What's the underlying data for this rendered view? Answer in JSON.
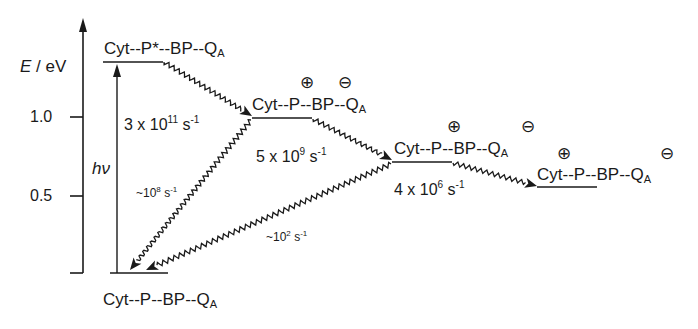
{
  "diagram": {
    "type": "energy-level-diagram",
    "axis": {
      "label_symbol": "E",
      "label_unit": " / eV",
      "ticks": [
        {
          "label": "1.0",
          "value": 1.0
        },
        {
          "label": "0.5",
          "value": 0.5
        }
      ]
    },
    "excitation_label": "hν",
    "states": [
      {
        "id": "excited",
        "prefix": "Cyt--P*--BP--Q",
        "subscript": "A",
        "plus_on": "",
        "minus_on": ""
      },
      {
        "id": "p_plus_bp_minus",
        "prefix": "Cyt--P--BP--Q",
        "subscript": "A",
        "plus_on": "P",
        "minus_on": "BP",
        "plus": "⊕",
        "minus": "⊖"
      },
      {
        "id": "p_plus_qa_minus",
        "prefix": "Cyt--P--BP--Q",
        "subscript": "A",
        "plus_on": "P",
        "minus_on": "QA",
        "plus": "⊕",
        "minus": "⊖"
      },
      {
        "id": "cyt_plus_qa_minus",
        "prefix": "Cyt--P--BP--Q",
        "subscript": "A",
        "plus_on": "Cyt",
        "minus_on": "QA",
        "plus": "⊕",
        "minus": "⊖"
      },
      {
        "id": "ground",
        "prefix": "Cyt--P--BP--Q",
        "subscript": "A",
        "plus_on": "",
        "minus_on": ""
      }
    ],
    "transitions": [
      {
        "from": "excited",
        "to": "p_plus_bp_minus",
        "base": "3 x 10",
        "exp": "11",
        "unit": " s",
        "unit_exp": "-1"
      },
      {
        "from": "p_plus_bp_minus",
        "to": "p_plus_qa_minus",
        "base": "5 x 10",
        "exp": "9",
        "unit": " s",
        "unit_exp": "-1"
      },
      {
        "from": "p_plus_qa_minus",
        "to": "cyt_plus_qa_minus",
        "base": "4 x 10",
        "exp": "6",
        "unit": " s",
        "unit_exp": "-1"
      },
      {
        "from": "p_plus_bp_minus",
        "to": "ground",
        "base": "~10",
        "exp": "8",
        "unit": " s",
        "unit_exp": "-1"
      },
      {
        "from": "p_plus_qa_minus",
        "to": "ground",
        "base": "~10",
        "exp": "2",
        "unit": " s",
        "unit_exp": "-1"
      }
    ]
  }
}
